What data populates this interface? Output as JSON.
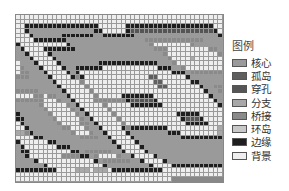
{
  "legend": {
    "title": "图例",
    "items": [
      {
        "code": "C",
        "label": "核心",
        "color": "#9a9a9a"
      },
      {
        "code": "I",
        "label": "孤岛",
        "color": "#5e5e5e"
      },
      {
        "code": "P",
        "label": "穿孔",
        "color": "#555555"
      },
      {
        "code": "R",
        "label": "分支",
        "color": "#a8a8a8"
      },
      {
        "code": "G",
        "label": "桥接",
        "color": "#8a8a8a"
      },
      {
        "code": "L",
        "label": "环岛",
        "color": "#c8c8c8"
      },
      {
        "code": "E",
        "label": "边缘",
        "color": "#1e1e1e"
      },
      {
        "code": "B",
        "label": "背景",
        "color": "#eeeeee"
      }
    ]
  },
  "grid": {
    "rows": [
      "BBBBBBBBBBBBBBBBBBBBBBBBBBBBBBBBBBBBBBBBBBBBB",
      "BBBBBBBBBBBBBBBBBBBBBBBBBBBBBBBBBBBBBBBBBBBBB",
      "BBEEEEEEEEEEEEEEEEBBBBBBEEEEEEEEEEEEEEEEEEEBB",
      "BBECCCCCCCCCCCCCCEEBBBBBEPPPPPPPPPPPPPPPPPPEBB",
      "BBECCCCCCEEEEEEECCEEEEEEECCCCCCCCCCCCCCCCCCEBB",
      "BBEEEEEEECCCCCCCCCCCCCCCCCGGGGGGGGGGGGGCCCCEBB",
      "BBBBBBBBECCCCCCCCCCCCCCCCCGBBBBBBBBGCCCCCCCEBB",
      "BBEEEEEEECCCCCCCCCCCCCCCCCGGGBBBBBBBBBGGCCCEBB",
      "BBECCCCCCCCCCCCCCCCCCCCCCCCGBBBBBBBBBBBGCCCEBB",
      "BBECCCCCCCCCCCCCCCCCCCCCCCCGBBBBRBBBBBBBCCCEBB",
      "BBECCCCCCCCEEEEEEEEEEEEECCCGBBBBBBBBBBBGCCCEBB",
      "BBECCEEEEEEBBBBBBBBBBBBEEECCGBBBBBBBBBGGCCCEBB",
      "BBECEBBBBBBBBBBBBBBBBBBBBEEECGGGGGGGGGGCCCCEBB",
      "BBEGEBBBBBBBBBBBBBBIIBBBBBBECCCCCCCCCCCCCCCEBB",
      "BBBGBBBBBBBBBBBBBBBIIBBBBBBEECCCCCCCCCCCCCCEBB",
      "BBBGBBBBBBBBBBBBBBBIIBBBBBBBECCGGGGGGGCCCCCEBB",
      "BBBGBBBBBBBBBBBBBBBBBBBBBBBBECCGBBBBGGBGGCCEBB",
      "BBBGBBBBBEEEEEEEBBBBBBBBBBBBECCGGGGGGBBBGCCEBB",
      "BBGGGGGGGEPPPPPEBBBBBBBBBBBBECCCCCCGBBBBBGCEBB",
      "BBBGBBBBBEEEEEEEBBBBBBBBBBBBECCCCCCGBBBBBGCEBB",
      "BBBGBBBBBBBBBBBBBBBBBBBBBBBBECCCCCCGBBBBBGCEBB",
      "BBBGBBBBBBBBBBBBBEEEEEBBBBBEECCCCCCGBBBBBGCEBB",
      "BBBGBBBBBBBBBBBBBEPPPEBBBBBECCCCCCCGBBBBGGCEBB",
      "BBBGBBBBBBBBBBBBBEEEEEBBBBBECCCCCCCGGBBBGCCEBB",
      "BBEGEEEEEEEEBBBBBBBBBBBRRRGECCCCCCCCGBBBGCCEBB",
      "BBECCCCCCCCEEEBBBBBBBBRBBBBEECCCCCCCCGGGGCCEBB",
      "BBECCCCCCCCCCEEEEEEEEEEBBBBBBEECCCCCCCCCCCCEBB",
      "BBECCCCCCCCCCCCCCCCCCCEBBBBBBBEEECCCCCCCCCCEBB",
      "BBECCCCCCCCCCCCCCCCCCEEBBBBBBBBBEECGGGGGGCCEBB",
      "BBECCCCCCCCCCCCCCCCCCEBBBBBBBGGGGEECGBBBBGCCEBB",
      "BBECCCCCCCCCCCCCCCCCCEBBBBBBBBBBBBECGGGGGGCCEBB",
      "BBECCCCCCCCCCCCCCCCCCEBBBBBBBBBBBBECCCCCCCCCEBB",
      "BBEEEEEEEEEEEEEEEEEEEEBBBBRRRBRRRBEEEEEEEEEEEBB",
      "BBBBBBBBBBBBBBBBBBBBBBBBBBBBBBBBBBBBBBBBBBBBB",
      "BBBBBBBBBBBBBBBBBBBBBBBBBBBBBBBBBBBBBBBBBBBBB"
    ]
  }
}
